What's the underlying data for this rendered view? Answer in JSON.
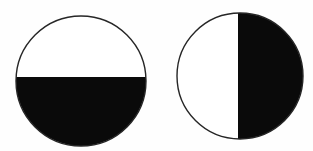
{
  "canvas": {
    "width": 313,
    "height": 151,
    "background_color": "#fefefe"
  },
  "figure": {
    "outline_color": "#262626",
    "outline_width": 1.4,
    "shade_color": "#0a0a0a",
    "unshaded_color": "#ffffff",
    "shapes": [
      {
        "name": "left-circle-bottom-half-shaded",
        "cx": 81,
        "cy": 81,
        "r": 65,
        "shaded_half": "bottom",
        "split_coord": 77,
        "shaded_fraction": "1/2"
      },
      {
        "name": "right-circle-right-half-shaded",
        "cx": 240,
        "cy": 76,
        "r": 63,
        "shaded_half": "right",
        "split_coord": 238,
        "shaded_fraction": "1/2"
      }
    ]
  }
}
